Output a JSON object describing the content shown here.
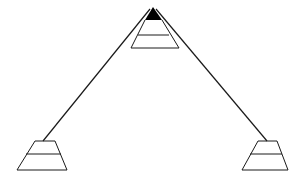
{
  "diagram": {
    "colors": {
      "stroke": "#1a1a1a",
      "fill_top": "#000000",
      "background": "#ffffff"
    },
    "top_stack": {
      "apex": [
        153,
        7
      ],
      "filled_tip_base_y": 20,
      "filled_tip_x": [
        145,
        162
      ],
      "middle_line_y": 35,
      "middle_line_x": [
        138,
        168
      ],
      "bottom_y": 48,
      "bottom_x": [
        131,
        179
      ]
    },
    "left_stack": {
      "top_y": 141,
      "top_x": [
        35,
        55
      ],
      "middle_y": 154,
      "middle_x": [
        26,
        61
      ],
      "bottom_y": 170,
      "bottom_x": [
        17,
        67
      ],
      "cable_anchor": [
        43,
        141
      ]
    },
    "right_stack": {
      "top_y": 141,
      "top_x": [
        258,
        277
      ],
      "middle_y": 154,
      "middle_x": [
        250,
        282
      ],
      "bottom_y": 170,
      "bottom_x": [
        242,
        288
      ],
      "cable_anchor": [
        267,
        141
      ]
    }
  }
}
